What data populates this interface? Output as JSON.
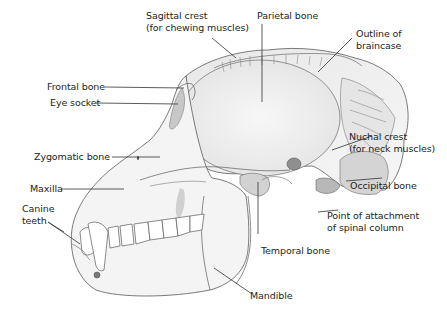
{
  "diagram": {
    "colors": {
      "bone_fill": "#f1f1f1",
      "bone_shade": "#d8d8d8",
      "line": "#5a5a5a",
      "leader": "#333333",
      "dark_shade": "#9a9a9a",
      "text": "#231f20"
    },
    "labels": {
      "sagittal_crest_1": "Sagittal crest",
      "sagittal_crest_2": "(for chewing muscles)",
      "parietal_bone": "Parietal bone",
      "outline_braincase_1": "Outline of",
      "outline_braincase_2": "braincase",
      "frontal_bone": "Frontal bone",
      "eye_socket": "Eye socket",
      "nuchal_crest_1": "Nuchal crest",
      "nuchal_crest_2": "(for neck muscles)",
      "zygomatic_bone": "Zygomatic bone",
      "maxilla": "Maxilla",
      "occipital_bone": "Occipital bone",
      "canine_teeth_1": "Canine",
      "canine_teeth_2": "teeth",
      "point_attachment_1": "Point of attachment",
      "point_attachment_2": "of spinal column",
      "temporal_bone": "Temporal bone",
      "mandible": "Mandible"
    }
  }
}
